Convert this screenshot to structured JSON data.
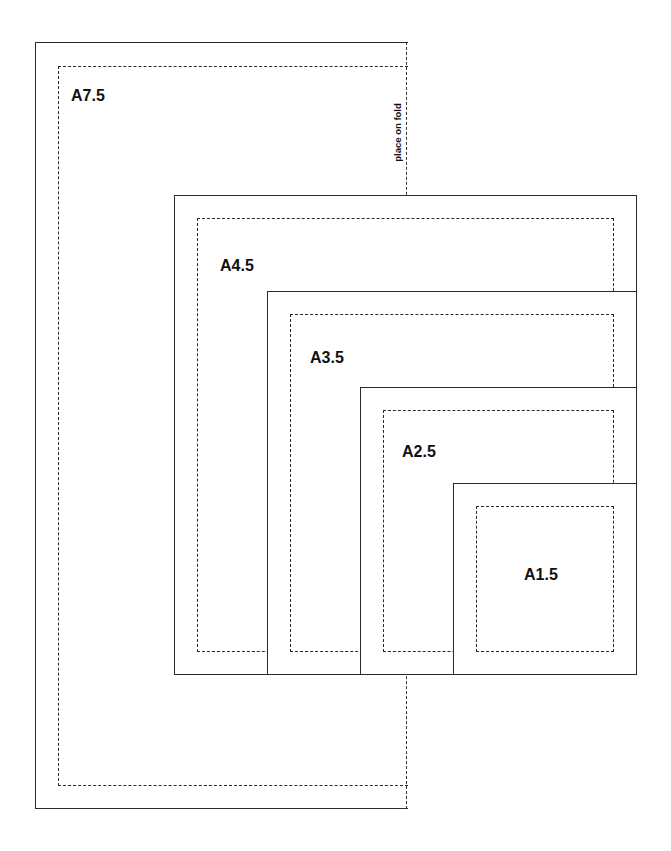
{
  "diagram": {
    "title": "",
    "fold_label": "place on fold",
    "line_color": "#2a2a2a",
    "templates": [
      {
        "id": "a7",
        "label": "A7.5"
      },
      {
        "id": "a4",
        "label": "A4.5"
      },
      {
        "id": "a3",
        "label": "A3.5"
      },
      {
        "id": "a2",
        "label": "A2.5"
      },
      {
        "id": "a1",
        "label": "A1.5"
      }
    ]
  }
}
